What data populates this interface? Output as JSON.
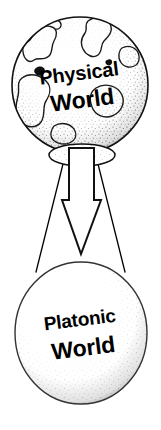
{
  "canvas": {
    "width": 161,
    "height": 430,
    "background_color": "#ffffff",
    "ink_color": "#000000",
    "stipple_color": "#5a5a5a"
  },
  "diagram": {
    "style": "hand-drawn stipple line art",
    "nodes": [
      {
        "id": "physical-world",
        "type": "globe",
        "label_line_1": "Physical",
        "label_line_2": "World",
        "center_x": 80,
        "center_y": 85,
        "radius_x": 68,
        "radius_y": 68,
        "has_continents": true,
        "has_stipple_shading": true,
        "text_rotation_deg": -7
      },
      {
        "id": "platonic-world",
        "type": "sphere",
        "label_line_1": "Platonic",
        "label_line_2": "World",
        "center_x": 81,
        "center_y": 333,
        "radius_x": 66,
        "radius_y": 71,
        "has_continents": false,
        "has_stipple_shading": true,
        "text_rotation_deg": -7
      }
    ],
    "connector": {
      "id": "projection-arrow",
      "type": "hollow-down-arrow",
      "direction": "down",
      "from": "physical-world",
      "to": "platonic-world",
      "fill": "#ffffff",
      "stroke": "#000000",
      "shaft_top_y": 152,
      "tip_y": 254
    },
    "projection_lines": [
      {
        "id": "projection-line-left",
        "x1": 64,
        "y1": 160,
        "x2": 36,
        "y2": 270
      },
      {
        "id": "projection-line-right",
        "x1": 97,
        "y1": 160,
        "x2": 125,
        "y2": 270
      }
    ],
    "pedestal": {
      "id": "globe-base-ellipse",
      "center_x": 82,
      "center_y": 155,
      "radius_x": 33,
      "radius_y": 11
    }
  }
}
